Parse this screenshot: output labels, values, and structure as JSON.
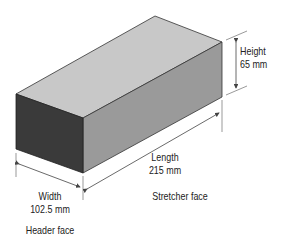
{
  "diagram": {
    "colors": {
      "top_face": "#c8c8c8",
      "stretcher_face": "#9a9a9a",
      "header_face": "#3a3a3a",
      "edge": "#333333",
      "dimension_line": "#444444"
    },
    "dimensions": {
      "height": {
        "label": "Height",
        "value": "65 mm"
      },
      "length": {
        "label": "Length",
        "value": "215 mm"
      },
      "width": {
        "label": "Width",
        "value": "102.5 mm"
      }
    },
    "faces": {
      "stretcher": "Stretcher face",
      "header": "Header face"
    }
  }
}
